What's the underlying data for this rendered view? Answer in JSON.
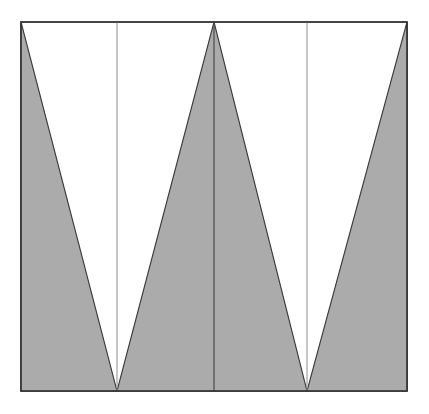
{
  "figure": {
    "canvas": {
      "width": 429,
      "height": 414,
      "background_color": "#ffffff"
    },
    "frame": {
      "name": "outer-frame",
      "x": 21,
      "y": 22,
      "width": 386,
      "height": 369,
      "fill_color": "#ffffff",
      "stroke_color": "#333333",
      "stroke_width": 1.4
    },
    "colors": {
      "gray_fill": "#ababab",
      "outline": "#3a3a3a",
      "thin_rule": "#8c8c8c",
      "background": "#ffffff"
    },
    "vertical_rules": [
      {
        "label": "rule-left",
        "x": 117,
        "y1": 22,
        "y2": 391,
        "color": "#8c8c8c",
        "width": 1
      },
      {
        "label": "rule-center",
        "x": 214,
        "y1": 22,
        "y2": 391,
        "color": "#4a4a4a",
        "width": 1.2
      },
      {
        "label": "rule-right",
        "x": 307,
        "y1": 22,
        "y2": 391,
        "color": "#8c8c8c",
        "width": 1
      }
    ],
    "shapes": [
      {
        "label": "left-wedge",
        "kind": "triangle",
        "points": "21,22 117,391 21,391",
        "fill_color": "#ababab",
        "stroke_color": "#3a3a3a"
      },
      {
        "label": "center-peak",
        "kind": "triangle",
        "points": "117,391 214,22 307,391",
        "fill_color": "#ababab",
        "stroke_color": "#3a3a3a"
      },
      {
        "label": "right-wedge",
        "kind": "triangle",
        "points": "307,391 407,22 407,391",
        "fill_color": "#ababab",
        "stroke_color": "#3a3a3a"
      }
    ],
    "vertices": {
      "top_left": "21,22",
      "top_right": "407,22",
      "bottom_left": "21,391",
      "bottom_right": "407,391",
      "valley_left": "117,391",
      "valley_right": "307,391",
      "peak_center": "214,22"
    }
  }
}
